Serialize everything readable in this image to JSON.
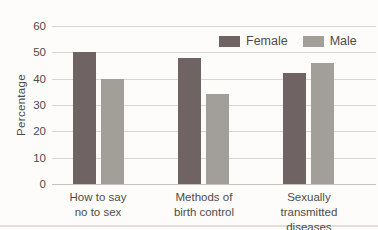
{
  "figure": {
    "background": "#fdfcfa"
  },
  "chart_data": {
    "type": "bar",
    "title": "",
    "xlabel": "",
    "ylabel": "Percentage",
    "ylim": [
      0,
      60
    ],
    "yticks": [
      0,
      10,
      20,
      30,
      40,
      50,
      60
    ],
    "grid": "horizontal",
    "gridline_color": "#d9d6d2",
    "legend_position": "top-right",
    "categories": [
      "How to say\nno to sex",
      "Methods of\nbirth control",
      "Sexually transmitted\ndiseases"
    ],
    "series": [
      {
        "name": "Female",
        "color": "#6f6363",
        "values": [
          50,
          48,
          42
        ]
      },
      {
        "name": "Male",
        "color": "#a29e99",
        "values": [
          40,
          34,
          46
        ]
      }
    ]
  }
}
